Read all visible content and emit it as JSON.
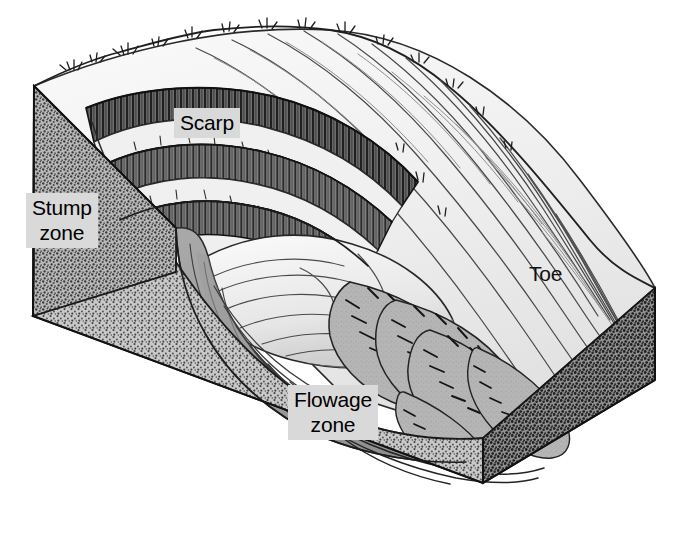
{
  "figure": {
    "kind": "block-diagram",
    "background_color": "#ffffff",
    "ink_color": "#1a1a1a",
    "label_box_color": "#d9d9d9",
    "palette": {
      "block_left_face": "#8a8a8a",
      "block_front_face": "#9c9c9c",
      "block_right_face": "#6e6e6e",
      "slip_surface": "#9a9a9a",
      "scarp_dark": "#3a3a3a",
      "hillslope_light": "#f2f2f2",
      "slump_block_light": "#e8e8e8",
      "flow_lobe_gray": "#b0b0b0"
    }
  },
  "labels": [
    {
      "id": "scarp",
      "text": "Scarp",
      "style": "boxed",
      "name": "label-scarp"
    },
    {
      "id": "stump",
      "text": "Stump\nzone",
      "style": "boxed",
      "name": "label-stump-zone"
    },
    {
      "id": "flowage",
      "text": "Flowage\nzone",
      "style": "boxed",
      "name": "label-flowage-zone"
    },
    {
      "id": "toe",
      "text": "Toe",
      "style": "plain",
      "name": "label-toe"
    }
  ],
  "features": {
    "scarp_bands": 3,
    "slump_blocks": 3,
    "flow_lobes": 5,
    "vegetation_tufts": "sparse shrubs along ridge crest and hillslope"
  }
}
